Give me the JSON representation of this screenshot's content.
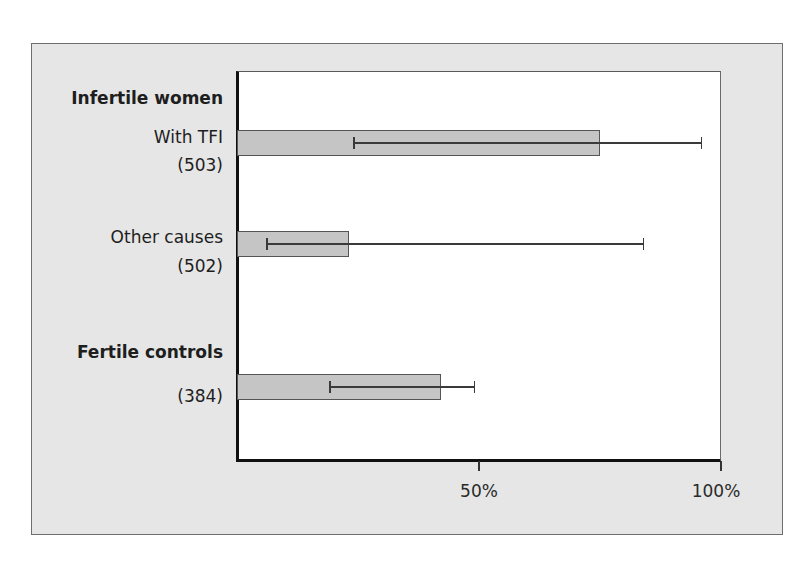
{
  "chart_data": {
    "type": "bar",
    "orientation": "horizontal",
    "title": "",
    "xlabel": "",
    "ylabel": "",
    "xlim": [
      0,
      100
    ],
    "x_ticks": [
      "50%",
      "100%"
    ],
    "grid": false,
    "legend": null,
    "groups": [
      {
        "name": "Infertile women",
        "categories": [
          {
            "label": "With TFI",
            "n": "(503)",
            "value": 75,
            "error_low": 24,
            "error_high": 96
          },
          {
            "label": "Other causes",
            "n": "(502)",
            "value": 23,
            "error_low": 6,
            "error_high": 84
          }
        ]
      },
      {
        "name": "Fertile controls",
        "categories": [
          {
            "label": "",
            "n": "(384)",
            "value": 42,
            "error_low": 19,
            "error_high": 49
          }
        ]
      }
    ],
    "categories": [
      "With TFI (503)",
      "Other causes (502)",
      "Fertile controls (384)"
    ],
    "values": [
      75,
      23,
      42
    ],
    "error_bars": [
      [
        24,
        96
      ],
      [
        6,
        84
      ],
      [
        19,
        49
      ]
    ],
    "units": "%"
  },
  "colors": {
    "panel_bg": "#e6e6e6",
    "plot_bg": "#ffffff",
    "bar_fill": "#c5c5c5",
    "bar_border": "#555555",
    "axis": "#111111"
  },
  "labels": {
    "group1": "Infertile women",
    "row1_name": "With TFI",
    "row1_n": "(503)",
    "row2_name": "Other causes",
    "row2_n": "(502)",
    "group2": "Fertile controls",
    "row3_n": "(384)"
  },
  "ticks": {
    "t50": "50%",
    "t100": "100%"
  }
}
